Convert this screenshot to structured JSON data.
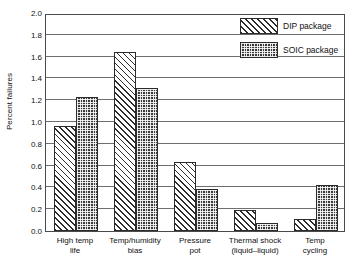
{
  "chart_data": {
    "type": "bar",
    "title": "",
    "xlabel": "",
    "ylabel": "Percent failures",
    "ylim": [
      0.0,
      2.0
    ],
    "ytick_labels": [
      "2.0",
      "1.8",
      "1.6",
      "1.4",
      "1.2",
      "1.0",
      "0.8",
      "0.6",
      "0.4",
      "0.2",
      "0.0"
    ],
    "ytick_values": [
      2.0,
      1.8,
      1.6,
      1.4,
      1.2,
      1.0,
      0.8,
      0.6,
      0.4,
      0.2,
      0.0
    ],
    "grid": true,
    "grid_axis": "y",
    "legend_position": "top-right",
    "categories": [
      "High temp life",
      "Temp/humidity bias",
      "Pressure pot",
      "Thermal shock (liquid–liquid)",
      "Temp cycling"
    ],
    "category_lines": [
      [
        "High temp",
        "life"
      ],
      [
        "Temp/humidity",
        "bias"
      ],
      [
        "Pressure",
        "pot"
      ],
      [
        "Thermal shock",
        "(liquid–liquid)"
      ],
      [
        "Temp",
        "cycling"
      ]
    ],
    "series": [
      {
        "name": "DIP package",
        "pattern": "diagonal-hatch",
        "color": "#ffffff",
        "values": [
          0.96,
          1.64,
          0.63,
          0.19,
          0.11
        ]
      },
      {
        "name": "SOIC package",
        "pattern": "checker-fill",
        "color": "#3a3a3a",
        "values": [
          1.23,
          1.31,
          0.39,
          0.07,
          0.42
        ]
      }
    ]
  },
  "legend": {
    "entries": [
      {
        "label": "DIP package"
      },
      {
        "label": "SOIC package"
      }
    ]
  }
}
